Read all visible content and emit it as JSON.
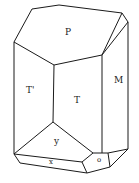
{
  "diagram": {
    "faces": [
      {
        "id": "P",
        "label": "P"
      },
      {
        "id": "T1",
        "label": "T'"
      },
      {
        "id": "T",
        "label": "T"
      },
      {
        "id": "M",
        "label": "M"
      },
      {
        "id": "y",
        "label": "y"
      },
      {
        "id": "x",
        "label": "x"
      },
      {
        "id": "o",
        "label": "o"
      }
    ],
    "line_color": "#1a1a1a"
  }
}
